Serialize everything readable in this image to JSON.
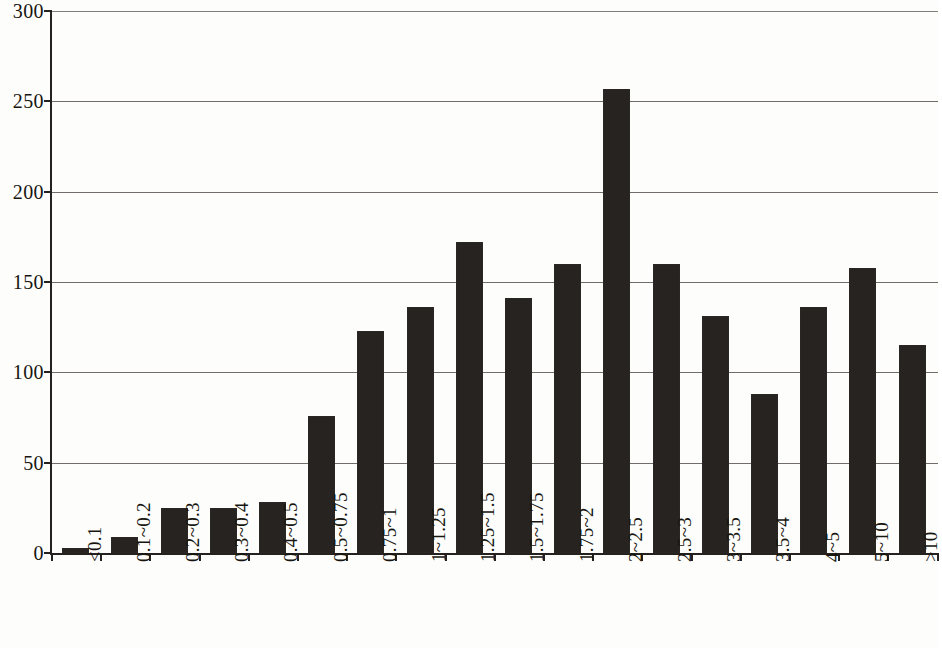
{
  "chart_data": {
    "type": "bar",
    "title": "",
    "subtitle": "",
    "xlabel": "",
    "ylabel": "",
    "ylim": [
      0,
      300
    ],
    "xlim_note": "categorical",
    "grid": true,
    "grid_axis": "y",
    "legend": false,
    "legend_position": "none",
    "bar_color": "#262320",
    "axis_color": "#24211e",
    "background_color": "#ffffff",
    "y_ticks": [
      0,
      50,
      100,
      150,
      200,
      250,
      300
    ],
    "y_tick_labels": [
      "0",
      "50",
      "100",
      "150",
      "200",
      "250",
      "300"
    ],
    "categories": [
      "<0.1",
      "0.1~0.2",
      "0.2~0.3",
      "0.3~0.4",
      "0.4~0.5",
      "0.5~0.75",
      "0.75~1",
      "1~1.25",
      "1.25~1.5",
      "1.5~1.75",
      "1.75~2",
      "2~2.5",
      "2.5~3",
      "3~3.5",
      "3.5~4",
      "4~5",
      "5~10",
      ">10"
    ],
    "values": [
      3,
      9,
      25,
      25,
      28,
      76,
      123,
      136,
      172,
      141,
      160,
      257,
      160,
      131,
      88,
      136,
      158,
      115
    ],
    "series": [
      {
        "name": "count",
        "values": [
          3,
          9,
          25,
          25,
          28,
          76,
          123,
          136,
          172,
          141,
          160,
          257,
          160,
          131,
          88,
          136,
          158,
          115
        ]
      }
    ],
    "x_label_rotation": -90
  }
}
